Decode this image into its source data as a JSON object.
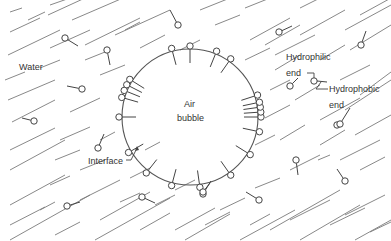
{
  "labels": {
    "water": "Water",
    "air_line1": "Air",
    "air_line2": "bubble",
    "hydrophilic_line1": "Hydrophilic",
    "hydrophilic_line2": "end",
    "hydrophobic_line1": "Hydrophobic",
    "hydrophobic_line2": "end",
    "interface": "Interface"
  },
  "bubble": {
    "cx": 190,
    "cy": 117,
    "r": 68
  },
  "colors": {
    "line": "#555555",
    "background": "#ffffff"
  },
  "water_lines": [
    [
      10,
      12,
      22,
      8
    ],
    [
      28,
      20,
      45,
      12
    ],
    [
      50,
      5,
      70,
      -2
    ],
    [
      10,
      32,
      40,
      18
    ],
    [
      48,
      15,
      85,
      -2
    ],
    [
      8,
      55,
      60,
      30
    ],
    [
      72,
      20,
      130,
      -5
    ],
    [
      50,
      48,
      90,
      30
    ],
    [
      85,
      45,
      140,
      18
    ],
    [
      115,
      35,
      170,
      10
    ],
    [
      5,
      80,
      25,
      72
    ],
    [
      40,
      68,
      60,
      60
    ],
    [
      85,
      60,
      110,
      50
    ],
    [
      8,
      100,
      55,
      80
    ],
    [
      100,
      75,
      125,
      65
    ],
    [
      12,
      122,
      55,
      100
    ],
    [
      70,
      112,
      100,
      98
    ],
    [
      10,
      150,
      55,
      128
    ],
    [
      60,
      140,
      90,
      127
    ],
    [
      10,
      170,
      65,
      140
    ],
    [
      55,
      160,
      80,
      150
    ],
    [
      100,
      140,
      115,
      132
    ],
    [
      10,
      205,
      65,
      175
    ],
    [
      50,
      185,
      70,
      176
    ],
    [
      80,
      170,
      105,
      160
    ],
    [
      10,
      225,
      45,
      207
    ],
    [
      40,
      210,
      55,
      202
    ],
    [
      80,
      200,
      120,
      180
    ],
    [
      145,
      150,
      160,
      142
    ],
    [
      10,
      240,
      90,
      195
    ],
    [
      55,
      235,
      80,
      222
    ],
    [
      100,
      220,
      150,
      192
    ],
    [
      120,
      202,
      140,
      193
    ],
    [
      155,
      205,
      175,
      195
    ],
    [
      95,
      240,
      170,
      198
    ],
    [
      140,
      230,
      170,
      213
    ],
    [
      175,
      230,
      215,
      208
    ],
    [
      220,
      210,
      245,
      198
    ],
    [
      185,
      240,
      230,
      214
    ],
    [
      240,
      240,
      295,
      210
    ],
    [
      290,
      220,
      330,
      200
    ],
    [
      270,
      230,
      340,
      190
    ],
    [
      300,
      240,
      360,
      205
    ],
    [
      330,
      225,
      365,
      208
    ],
    [
      345,
      215,
      385,
      195
    ],
    [
      355,
      240,
      391,
      220
    ],
    [
      370,
      232,
      391,
      222
    ],
    [
      255,
      188,
      280,
      178
    ],
    [
      290,
      170,
      320,
      155
    ],
    [
      340,
      160,
      380,
      140
    ],
    [
      318,
      160,
      330,
      155
    ],
    [
      360,
      170,
      385,
      157
    ],
    [
      255,
      145,
      275,
      135
    ],
    [
      280,
      140,
      305,
      125
    ],
    [
      320,
      145,
      345,
      130
    ],
    [
      320,
      120,
      360,
      98
    ],
    [
      345,
      110,
      391,
      80
    ],
    [
      355,
      135,
      391,
      115
    ],
    [
      265,
      118,
      290,
      105
    ],
    [
      295,
      100,
      320,
      85
    ],
    [
      270,
      90,
      290,
      80
    ],
    [
      340,
      80,
      370,
      65
    ],
    [
      360,
      95,
      391,
      72
    ],
    [
      275,
      70,
      300,
      55
    ],
    [
      320,
      60,
      345,
      45
    ],
    [
      350,
      50,
      391,
      25
    ],
    [
      265,
      45,
      300,
      25
    ],
    [
      300,
      35,
      345,
      10
    ],
    [
      345,
      30,
      391,
      5
    ],
    [
      275,
      55,
      315,
      35
    ],
    [
      215,
      25,
      240,
      15
    ],
    [
      250,
      40,
      290,
      18
    ],
    [
      200,
      10,
      230,
      -2
    ],
    [
      245,
      8,
      270,
      -2
    ],
    [
      300,
      8,
      320,
      -2
    ],
    [
      360,
      15,
      391,
      -2
    ],
    [
      180,
      50,
      200,
      40
    ],
    [
      245,
      60,
      270,
      48
    ],
    [
      125,
      30,
      140,
      22
    ],
    [
      140,
      48,
      165,
      35
    ],
    [
      205,
      225,
      230,
      212
    ],
    [
      250,
      225,
      270,
      214
    ],
    [
      130,
      178,
      150,
      168
    ],
    [
      175,
      190,
      195,
      180
    ]
  ],
  "free_molecules": [
    {
      "hx": 65,
      "hy": 38,
      "tx": 78,
      "ty": 46
    },
    {
      "hx": 107,
      "hy": 50,
      "tx": 110,
      "ty": 65
    },
    {
      "hx": 82,
      "hy": 89,
      "tx": 67,
      "ty": 86
    },
    {
      "hx": 34,
      "hy": 121,
      "tx": 22,
      "ty": 118
    },
    {
      "hx": 178,
      "hy": 25,
      "tx": 170,
      "ty": 10
    },
    {
      "hx": 279,
      "hy": 32,
      "tx": 292,
      "ty": 26
    },
    {
      "hx": 361,
      "hy": 45,
      "tx": 366,
      "ty": 31
    },
    {
      "hx": 98,
      "hy": 148,
      "tx": 104,
      "ty": 134
    },
    {
      "hx": 67,
      "hy": 206,
      "tx": 80,
      "ty": 202
    },
    {
      "hx": 142,
      "hy": 197,
      "tx": 155,
      "ty": 203
    },
    {
      "hx": 259,
      "hy": 200,
      "tx": 246,
      "ty": 192
    },
    {
      "hx": 203,
      "hy": 194,
      "tx": 211,
      "ty": 181
    },
    {
      "hx": 296,
      "hy": 160,
      "tx": 298,
      "ty": 175
    },
    {
      "hx": 345,
      "hy": 181,
      "tx": 337,
      "ty": 169
    },
    {
      "hx": 337,
      "hy": 125,
      "tx": 342,
      "ty": 125
    },
    {
      "hx": 340,
      "hy": 124,
      "tx": 350,
      "ty": 108
    },
    {
      "hx": 203,
      "hy": 192,
      "tx": 210,
      "ty": 183
    },
    {
      "hx": 290,
      "hy": 86,
      "tx": 298,
      "ty": 78
    }
  ],
  "interface_angles_deg": [
    -105,
    -90,
    -68,
    -55,
    -148,
    -153,
    -158,
    -164,
    180,
    150,
    128,
    105,
    82,
    55,
    32,
    12,
    0,
    -4,
    -8,
    -12,
    -18
  ]
}
